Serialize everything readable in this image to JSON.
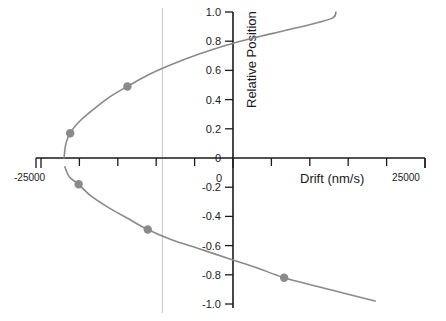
{
  "chart_data": {
    "type": "scatter",
    "title": "",
    "xlabel": "Drift (nm/s)",
    "ylabel": "Relative Position",
    "xlim": [
      -25000,
      25000
    ],
    "ylim": [
      -1.0,
      1.0
    ],
    "grid": false,
    "legend": "none",
    "x_tick_labels": [
      "-25000",
      "0",
      "25000"
    ],
    "x_tick_values": [
      -25000,
      0,
      25000
    ],
    "x_minor_tick_values": [
      -20000,
      -15000,
      -10000,
      -5000,
      5000,
      10000,
      15000,
      20000
    ],
    "y_tick_labels": [
      "1.0",
      "0.8",
      "0.6",
      "0.4",
      "0.2",
      "0",
      "-0.2",
      "-0.4",
      "-0.6",
      "-0.8",
      "-1.0"
    ],
    "y_tick_values": [
      1.0,
      0.8,
      0.6,
      0.4,
      0.2,
      0,
      -0.2,
      -0.4,
      -0.6,
      -0.8,
      -1.0
    ],
    "annotations": [
      {
        "name": "vertical-reference-line",
        "x": -9200,
        "orientation": "vertical",
        "color": "#c9c9c9"
      }
    ],
    "series": [
      {
        "name": "drift-curve",
        "type": "line",
        "color": "#8a8a8a",
        "comment": "sideways parabola, opens to the right, vertex near (-22000, 0)",
        "points": [
          {
            "x": -22000,
            "y": 0.0
          },
          {
            "x": -21750,
            "y": 0.1
          },
          {
            "x": -21100,
            "y": 0.18
          },
          {
            "x": -19800,
            "y": 0.26
          },
          {
            "x": -18000,
            "y": 0.34
          },
          {
            "x": -16000,
            "y": 0.42
          },
          {
            "x": -13750,
            "y": 0.49
          },
          {
            "x": -11000,
            "y": 0.57
          },
          {
            "x": -8000,
            "y": 0.64
          },
          {
            "x": -4500,
            "y": 0.71
          },
          {
            "x": -1000,
            "y": 0.77
          },
          {
            "x": 2500,
            "y": 0.82
          },
          {
            "x": 6500,
            "y": 0.87
          },
          {
            "x": 10500,
            "y": 0.92
          },
          {
            "x": 13000,
            "y": 0.96
          },
          {
            "x": 13400,
            "y": 1.0
          },
          {
            "x": -21900,
            "y": -0.06
          },
          {
            "x": -21300,
            "y": -0.13
          },
          {
            "x": -20100,
            "y": -0.18
          },
          {
            "x": -18500,
            "y": -0.26
          },
          {
            "x": -16200,
            "y": -0.34
          },
          {
            "x": -13500,
            "y": -0.42
          },
          {
            "x": -11100,
            "y": -0.49
          },
          {
            "x": -8000,
            "y": -0.56
          },
          {
            "x": -4500,
            "y": -0.62
          },
          {
            "x": -500,
            "y": -0.69
          },
          {
            "x": 3000,
            "y": -0.75
          },
          {
            "x": 6660,
            "y": -0.82
          },
          {
            "x": 11000,
            "y": -0.88
          },
          {
            "x": 15500,
            "y": -0.94
          },
          {
            "x": 18500,
            "y": -0.98
          }
        ]
      },
      {
        "name": "measured-points",
        "type": "scatter",
        "color": "#8a8a8a",
        "marker": "circle",
        "points": [
          {
            "x": -21200,
            "y": 0.17
          },
          {
            "x": -13750,
            "y": 0.49
          },
          {
            "x": -20100,
            "y": -0.18
          },
          {
            "x": -11100,
            "y": -0.49
          },
          {
            "x": 6660,
            "y": -0.82
          }
        ]
      }
    ]
  },
  "axis": {
    "x_label": "Drift (nm/s)",
    "y_label": "Relative Position",
    "x_min_label": "-25000",
    "x_zero_label": "0",
    "x_max_label": "25000"
  }
}
